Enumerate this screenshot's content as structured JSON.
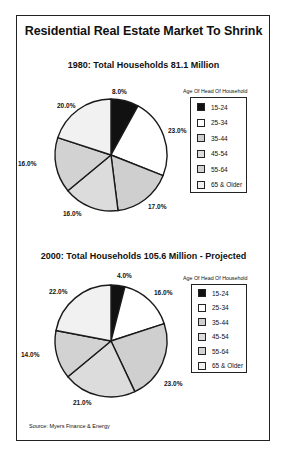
{
  "title": "Residential Real Estate Market To Shrink",
  "source": "Source:  Myers Finance & Energy",
  "colors": {
    "15-24": "#111111",
    "25-34": "#ffffff",
    "35-44": "#cfcfcf",
    "45-54": "#dcdcdc",
    "55-64": "#d2d2d2",
    "65 & Older": "#f1f1f1",
    "stroke": "#1a1a1a"
  },
  "chart_data": [
    {
      "type": "pie",
      "title": "1980: Total Households 81.1 Million",
      "legend_title": "Age Of Head Of Household",
      "legend_position": "right",
      "categories": [
        "15-24",
        "25-34",
        "35-44",
        "45-54",
        "55-64",
        "65 & Older"
      ],
      "values": [
        8.0,
        23.0,
        17.0,
        16.0,
        16.0,
        20.0
      ],
      "labels": [
        "8.0%",
        "23.0%",
        "17.0%",
        "16.0%",
        "16.0%",
        "20.0%"
      ],
      "start_angle": "12 o'clock, clockwise"
    },
    {
      "type": "pie",
      "title": "2000: Total Households 105.6 Million - Projected",
      "legend_title": "Age Of Head Of Household",
      "legend_position": "right",
      "categories": [
        "15-24",
        "25-34",
        "35-44",
        "45-54",
        "55-64",
        "65 & Older"
      ],
      "values": [
        4.0,
        16.0,
        23.0,
        21.0,
        14.0,
        22.0
      ],
      "labels": [
        "4.0%",
        "16.0%",
        "23.0%",
        "21.0%",
        "14.0%",
        "22.0%"
      ],
      "start_angle": "12 o'clock, clockwise"
    }
  ]
}
